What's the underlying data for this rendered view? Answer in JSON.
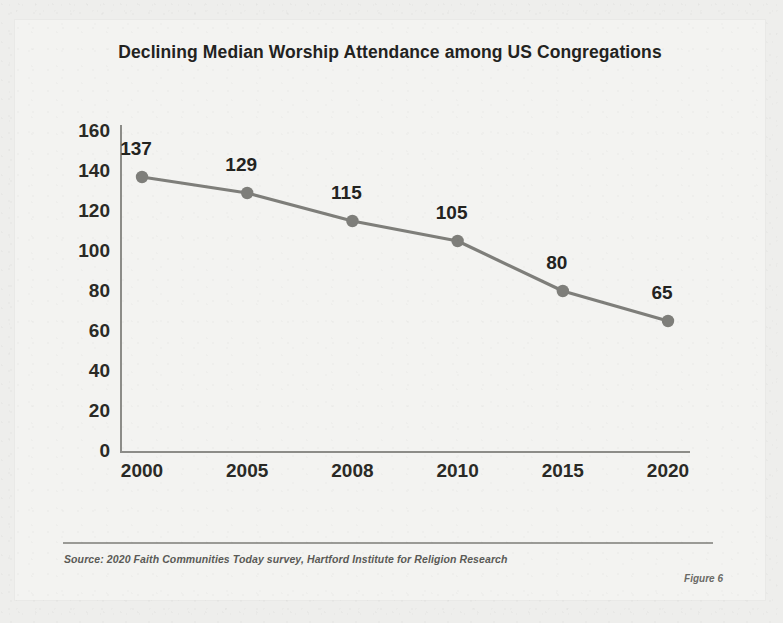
{
  "figure": {
    "caption": "Figure 6",
    "source_note": "Source: 2020 Faith Communities Today survey, Hartford Institute for Religion Research"
  },
  "colors": {
    "page_background": "#eeeeec",
    "card_background": "#f3f3f1",
    "line": "#7e7e7a",
    "marker": "#7e7e7a",
    "axis": "#8c8c88",
    "text": "#23231f"
  },
  "chart_data": {
    "type": "line",
    "title": "Declining Median Worship Attendance among US Congregations",
    "xlabel": "",
    "ylabel": "",
    "categories": [
      "2000",
      "2005",
      "2008",
      "2010",
      "2015",
      "2020"
    ],
    "values": [
      137,
      129,
      115,
      105,
      80,
      65
    ],
    "point_labels": [
      "137",
      "129",
      "115",
      "105",
      "80",
      "65"
    ],
    "ylim": [
      0,
      160
    ],
    "ytick_labels": [
      "160",
      "140",
      "120",
      "100",
      "80",
      "60",
      "40",
      "20",
      "0"
    ],
    "ytick_values": [
      160,
      140,
      120,
      100,
      80,
      60,
      40,
      20,
      0
    ],
    "grid": false,
    "legend": false,
    "markers": true
  }
}
